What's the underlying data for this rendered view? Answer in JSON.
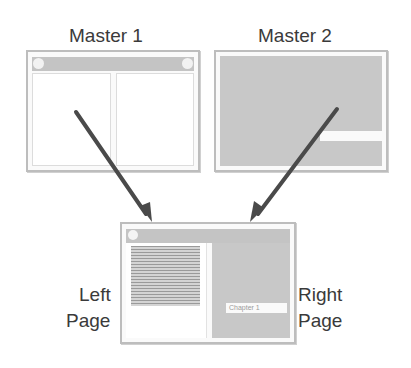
{
  "diagram": {
    "masters": [
      {
        "label": "Master 1",
        "layout": "two-column with header bar and corner circles"
      },
      {
        "label": "Master 2",
        "layout": "solid gray with white horizontal band"
      }
    ],
    "result": {
      "left_label_line1": "Left",
      "left_label_line2": "Page",
      "right_label_line1": "Right",
      "right_label_line2": "Page",
      "chapter_text": "Chapter 1"
    },
    "colors": {
      "gray_fill": "#c8c8c8",
      "header_bar": "#c4c4c4",
      "border": "#bdbdbd",
      "arrow": "#4a4a4a",
      "text": "#3a3a3a"
    }
  }
}
